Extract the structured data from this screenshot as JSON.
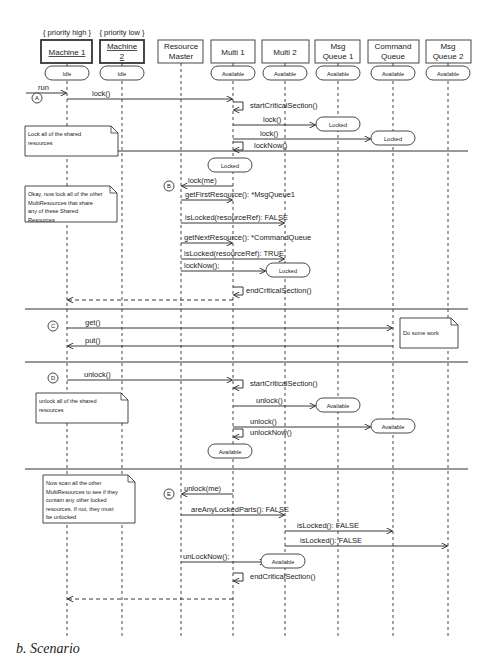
{
  "diagram": {
    "type": "uml-sequence-diagram",
    "caption": "b. Scenario",
    "stereotypes": [
      {
        "text": "{ priority high }",
        "lifeline": "machine1"
      },
      {
        "text": "{ priority low }",
        "lifeline": "machine2"
      }
    ],
    "lifelines": [
      {
        "id": "machine1",
        "label": [
          "Machine 1"
        ],
        "x": 67,
        "box": [
          41,
          92
        ],
        "bold": true,
        "underline": true,
        "initial_state": "Idle"
      },
      {
        "id": "machine2",
        "label": [
          "Machine",
          "2"
        ],
        "x": 122,
        "box": [
          100,
          144
        ],
        "bold": true,
        "underline": true,
        "initial_state": "Idle"
      },
      {
        "id": "resource-master",
        "label": [
          "Resource",
          "Master"
        ],
        "x": 181,
        "box": [
          158,
          203
        ],
        "bold": false,
        "underline": false,
        "initial_state": ""
      },
      {
        "id": "multi1",
        "label": [
          "Multi 1"
        ],
        "x": 233,
        "box": [
          211,
          255
        ],
        "bold": false,
        "underline": false,
        "initial_state": "Available"
      },
      {
        "id": "multi2",
        "label": [
          "Multi 2"
        ],
        "x": 285,
        "box": [
          262,
          309
        ],
        "bold": false,
        "underline": false,
        "initial_state": "Available"
      },
      {
        "id": "msg-queue1",
        "label": [
          "Msg",
          "Queue 1"
        ],
        "x": 338,
        "box": [
          315,
          360
        ],
        "bold": false,
        "underline": false,
        "initial_state": "Available"
      },
      {
        "id": "command-queue",
        "label": [
          "Command",
          "Queue"
        ],
        "x": 393,
        "box": [
          368,
          419
        ],
        "bold": false,
        "underline": false,
        "initial_state": "Available"
      },
      {
        "id": "msg-queue2",
        "label": [
          "Msg",
          "Queue 2"
        ],
        "x": 448,
        "box": [
          426,
          471
        ],
        "bold": false,
        "underline": false,
        "initial_state": "Available"
      }
    ],
    "separators": [
      151,
      309,
      362,
      469
    ],
    "step_markers": [
      {
        "label": "A",
        "x": 37,
        "y": 98
      },
      {
        "label": "B",
        "x": 169,
        "y": 186
      },
      {
        "label": "C",
        "x": 53,
        "y": 326
      },
      {
        "label": "D",
        "x": 53,
        "y": 378
      },
      {
        "label": "E",
        "x": 169,
        "y": 494
      }
    ],
    "notes": [
      {
        "lines": [
          "Lock all of the shared",
          "resources"
        ],
        "x": 25,
        "y": 126,
        "w": 93,
        "h": 30
      },
      {
        "lines": [
          "Okay, now lock all of the other",
          "MultiResources that share",
          "any of these Shared",
          "Resources"
        ],
        "x": 25,
        "y": 186,
        "w": 92,
        "h": 36
      },
      {
        "lines": [
          "Do some work"
        ],
        "x": 400,
        "y": 318,
        "w": 58,
        "h": 30
      },
      {
        "lines": [
          "unlock all of the shared",
          "resources"
        ],
        "x": 36,
        "y": 393,
        "w": 92,
        "h": 30
      },
      {
        "lines": [
          "Now scan all the other",
          "MultiResources to see if they",
          "contain any other locked",
          "resources. If not, they must",
          "be unlocked"
        ],
        "x": 43,
        "y": 475,
        "w": 92,
        "h": 48
      }
    ],
    "messages": [
      {
        "label": "run",
        "from_x": 26,
        "to_x": 67,
        "y": 93,
        "kind": "sync",
        "label_x": 38
      },
      {
        "label": "lock()",
        "from": "machine1",
        "to": "multi1",
        "y": 99,
        "kind": "sync",
        "label_x": 92
      },
      {
        "label": "startCriticalSection()",
        "self": "multi1",
        "y": 106,
        "kind": "self",
        "label_x": 250
      },
      {
        "label": "lock()",
        "from": "multi1",
        "to": "msg-queue1",
        "y": 125,
        "kind": "sync",
        "label_x": 263
      },
      {
        "label": "lock()",
        "from": "multi1",
        "to": "command-queue",
        "y": 139,
        "kind": "sync",
        "label_x": 260
      },
      {
        "label": "lockNow()",
        "self": "multi1",
        "y": 146,
        "kind": "self",
        "label_x": 254
      },
      {
        "label": "lock(me)",
        "from": "multi1",
        "to": "resource-master",
        "y": 186,
        "kind": "sync",
        "label_x": 188
      },
      {
        "label": "getFirstResource(): *MsgQueue1",
        "from": "resource-master",
        "to": "multi1",
        "y": 200,
        "kind": "sync",
        "label_x": 185
      },
      {
        "label": "isLocked(resourceRef): FALSE",
        "from": "resource-master",
        "to": "multi2",
        "y": 223,
        "kind": "sync",
        "label_x": 185
      },
      {
        "label": "getNextResource(): *CommandQueue",
        "from": "resource-master",
        "to": "multi1",
        "y": 243,
        "kind": "sync",
        "label_x": 184
      },
      {
        "label": "isLocked(resourceRef): TRUE",
        "from": "resource-master",
        "to": "multi2",
        "y": 259,
        "kind": "sync",
        "label_x": 184
      },
      {
        "label": "lockNow();",
        "from": "resource-master",
        "to": "multi2-state",
        "y": 271,
        "kind": "sync",
        "label_x": 184
      },
      {
        "label": "endCriticalSection()",
        "self": "multi1",
        "y": 291,
        "kind": "self",
        "label_x": 246
      },
      {
        "label": "",
        "from": "multi1",
        "to": "machine1",
        "y": 300,
        "kind": "return"
      },
      {
        "label": "get()",
        "from": "machine1",
        "to": "command-queue",
        "y": 328,
        "kind": "sync",
        "label_x": 85
      },
      {
        "label": "put()",
        "from": "command-queue",
        "to": "machine1",
        "y": 346,
        "kind": "sync",
        "label_x": 85
      },
      {
        "label": "unlock()",
        "from": "machine1",
        "to": "multi1",
        "y": 380,
        "kind": "sync",
        "label_x": 84
      },
      {
        "label": "startCriticalSection()",
        "self": "multi1",
        "y": 384,
        "kind": "self",
        "label_x": 250
      },
      {
        "label": "unlock()",
        "from": "multi1",
        "to": "msg-queue1",
        "y": 406,
        "kind": "sync",
        "label_x": 256
      },
      {
        "label": "unlock()",
        "from": "multi1",
        "to": "command-queue",
        "y": 427,
        "kind": "sync",
        "label_x": 250
      },
      {
        "label": "unlockNow()",
        "self": "multi1",
        "y": 433,
        "kind": "self",
        "label_x": 250
      },
      {
        "label": "unlock(me)",
        "from": "multi1",
        "to": "resource-master",
        "y": 494,
        "kind": "sync",
        "label_x": 184
      },
      {
        "label": "areAnyLockedParts(): FALSE",
        "from": "resource-master",
        "to": "multi2",
        "y": 515,
        "kind": "sync",
        "label_x": 191
      },
      {
        "label": "isLocked(): FALSE",
        "from": "multi2",
        "to": "command-queue",
        "y": 531,
        "kind": "sync",
        "label_x": 297
      },
      {
        "label": "isLocked(): FALSE",
        "from": "multi2",
        "to": "msg-queue2",
        "y": 546,
        "kind": "sync",
        "label_x": 300
      },
      {
        "label": "unLockNow();",
        "from": "resource-master",
        "to": "multi2-state",
        "y": 562,
        "kind": "sync",
        "label_x": 183
      },
      {
        "label": "endCriticalSection()",
        "self": "multi1",
        "y": 577,
        "kind": "self",
        "label_x": 250
      },
      {
        "label": "",
        "from": "multi1",
        "to": "machine1",
        "y": 599,
        "kind": "return"
      }
    ],
    "states": [
      {
        "label": "Locked",
        "cx": 338,
        "y": 117,
        "w": 44
      },
      {
        "label": "Locked",
        "cx": 393,
        "y": 131,
        "w": 44
      },
      {
        "label": "Locked",
        "cx": 230,
        "y": 158,
        "w": 44
      },
      {
        "label": "Locked",
        "cx": 288,
        "y": 263,
        "w": 44
      },
      {
        "label": "Available",
        "cx": 338,
        "y": 398,
        "w": 44
      },
      {
        "label": "Available",
        "cx": 393,
        "y": 419,
        "w": 44
      },
      {
        "label": "Available",
        "cx": 230,
        "y": 444,
        "w": 44
      },
      {
        "label": "Available",
        "cx": 283,
        "y": 554,
        "w": 44
      }
    ]
  }
}
